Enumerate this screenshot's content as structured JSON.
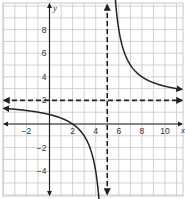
{
  "chart_data": {
    "type": "line",
    "title": "",
    "xlabel": "x",
    "ylabel": "y",
    "xlim": [
      -4,
      11.5
    ],
    "ylim": [
      -6,
      10.2
    ],
    "grid": true,
    "x_ticks": [
      -2,
      2,
      4,
      6,
      8,
      10
    ],
    "y_ticks": [
      8,
      6,
      4,
      2,
      -2,
      -4
    ],
    "x_tick_labels": [
      "−2",
      "2",
      "4",
      "6",
      "8",
      "10"
    ],
    "y_tick_labels": [
      "8",
      "6",
      "4",
      "2",
      "−2",
      "−4"
    ],
    "function": "y = 2 + 6/(x - 5)",
    "series": [
      {
        "name": "left branch",
        "style": "solid",
        "x": [
          -3.8,
          -3,
          -2,
          -1,
          0,
          1,
          2,
          3,
          3.5,
          4,
          4.3
        ],
        "y": [
          1.3,
          1.25,
          1.14,
          1.0,
          0.8,
          0.5,
          0.0,
          -1.0,
          -2.0,
          -4.0,
          -6.0
        ]
      },
      {
        "name": "right branch",
        "style": "solid",
        "x": [
          5.7,
          6,
          6.5,
          7,
          8,
          9,
          10,
          11,
          11.5
        ],
        "y": [
          10.2,
          8.0,
          6.0,
          5.0,
          4.0,
          3.5,
          3.2,
          3.0,
          2.92
        ]
      }
    ],
    "asymptotes": [
      {
        "name": "vertical asymptote",
        "orientation": "vertical",
        "value": 5,
        "style": "dashed"
      },
      {
        "name": "horizontal asymptote",
        "orientation": "horizontal",
        "value": 2,
        "style": "dashed"
      }
    ]
  },
  "colors": {
    "grid": "#c8c8c8",
    "axis": "#222222",
    "curve": "#222222",
    "background": "#ffffff"
  }
}
